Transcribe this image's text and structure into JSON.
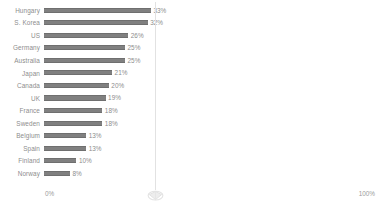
{
  "chart_data": {
    "type": "bar",
    "orientation": "horizontal",
    "title": "",
    "subtitle": "",
    "xlabel": "",
    "ylabel": "",
    "grid": false,
    "legend": null,
    "xlim": [
      0,
      100
    ],
    "x_tick_labels": [
      "0%",
      "100%"
    ],
    "value_suffix": "%",
    "categories": [
      "Hungary",
      "S. Korea",
      "US",
      "Germany",
      "Australia",
      "Japan",
      "Canada",
      "UK",
      "France",
      "Sweden",
      "Belgium",
      "Spain",
      "Finland",
      "Norway"
    ],
    "values": [
      33,
      32,
      26,
      25,
      25,
      21,
      20,
      19,
      18,
      18,
      13,
      13,
      10,
      8
    ],
    "value_labels": [
      "33%",
      "32%",
      "26%",
      "25%",
      "25%",
      "21%",
      "20%",
      "19%",
      "18%",
      "18%",
      "13%",
      "13%",
      "10%",
      "8%"
    ],
    "annotations": [
      {
        "type": "vertical-reference-line",
        "value": 33,
        "label": ""
      }
    ]
  },
  "colors": {
    "bar": "#808080",
    "bar_edge": "#6f6f6f",
    "label_text": "#8d8d8d",
    "axis_text": "#9b9b9b",
    "gridline": "#e2e2e2",
    "marker": "#e0e0e0",
    "background": "#ffffff"
  },
  "axis": {
    "min_label": "0%",
    "max_label": "100%"
  },
  "marker": {
    "icon": "diamond-marker-icon"
  }
}
